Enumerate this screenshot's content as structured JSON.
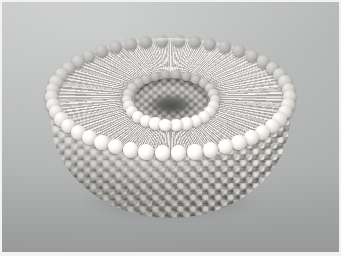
{
  "figure": {
    "subject": "liposome",
    "title": "Phospholipid bilayer vesicle (liposome) cutaway",
    "render_style": "grayscale airbrush / 3D raytraced illustration",
    "view": "three-quarter perspective from above",
    "light_direction": "upper-left"
  },
  "canvas": {
    "width_px": 341,
    "height_px": 256,
    "frame_margin_px": 2,
    "frame_color": "#f2f2f2"
  },
  "background": {
    "type": "smooth vertical gradient",
    "top_color": "#c8c9c9",
    "mid_color": "#bdbebe",
    "bottom_color": "#a9aaaa",
    "grain": "fine scan noise"
  },
  "structure": {
    "outer_leaflet": {
      "name": "outer monolayer head groups",
      "appearance": "hexagonally close-packed glossy spheres covering the outer bowl surface",
      "bead_color_light": "#ffffff",
      "bead_color_mid": "#dedbd6",
      "bead_color_shadow": "#97948f"
    },
    "cut_face": {
      "name": "bilayer cross-section (annular cut face)",
      "appearance": "hydrocarbon tails radiating between the outer and inner head-group rings",
      "tail_count_per_head": 2,
      "tail_color": "#e6e4e0"
    },
    "inner_leaflet": {
      "name": "inner monolayer head groups",
      "appearance": "ring of spheres lining the aqueous lumen"
    },
    "lumen": {
      "name": "aqueous interior",
      "appearance": "dark recessed pore at the centre",
      "core_color": "#4f4f4f"
    },
    "shadow": {
      "name": "cast shadow",
      "color": "rgba(96,98,100,0.46)"
    }
  },
  "geometry": {
    "vesicle_left_px": 46,
    "vesicle_top_px": 36,
    "vesicle_width_px": 245,
    "vesicle_height_px": 180,
    "outer_rim_ring_beads": 46,
    "inner_rim_ring_beads": 26,
    "pore_center_x_px": 169,
    "pore_center_y_px": 98
  }
}
